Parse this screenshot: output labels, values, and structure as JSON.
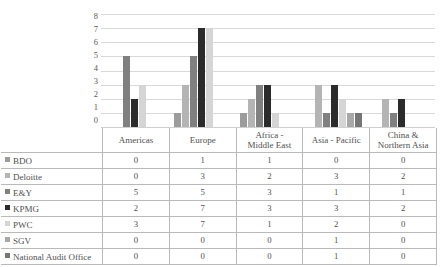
{
  "chart_data": {
    "type": "bar",
    "title": "",
    "subtitle": "",
    "xlabel": "",
    "ylabel": "",
    "ylim": [
      0,
      8
    ],
    "yticks": [
      8,
      7,
      6,
      5,
      4,
      3,
      2,
      1,
      0
    ],
    "grid": true,
    "legend_position": "table",
    "categories": [
      "Americas",
      "Europe",
      "Africa - Middle East",
      "Asia - Pacific",
      "China & Northern Asia"
    ],
    "category_lines": [
      [
        "Americas"
      ],
      [
        "Europe"
      ],
      [
        "Africa -",
        "Middle East"
      ],
      [
        "Asia - Pacific"
      ],
      [
        "China &",
        "Northern Asia"
      ]
    ],
    "series": [
      {
        "name": "BDO",
        "color": "#9c9c9c",
        "values": [
          0,
          1,
          1,
          0,
          0
        ]
      },
      {
        "name": "Deloitte",
        "color": "#b4b4b4",
        "values": [
          0,
          3,
          2,
          3,
          2
        ]
      },
      {
        "name": "E&Y",
        "color": "#808080",
        "values": [
          5,
          5,
          3,
          1,
          1
        ]
      },
      {
        "name": "KPMG",
        "color": "#2b2b2b",
        "values": [
          2,
          7,
          3,
          3,
          2
        ]
      },
      {
        "name": "PWC",
        "color": "#d5d5d5",
        "values": [
          3,
          7,
          1,
          2,
          0
        ]
      },
      {
        "name": "SGV",
        "color": "#a8a8a8",
        "values": [
          0,
          0,
          0,
          1,
          0
        ]
      },
      {
        "name": "National Audit Office",
        "color": "#767676",
        "values": [
          0,
          0,
          0,
          1,
          0
        ]
      }
    ]
  },
  "table": {
    "corner_label": "",
    "row_labels": [
      "BDO",
      "Deloitte",
      "E&Y",
      "KPMG",
      "PWC",
      "SGV",
      "National Audit Office"
    ],
    "column_headers": [
      "Americas",
      "Europe",
      "Africa - Middle East",
      "Asia - Pacific",
      "China & Northern Asia"
    ],
    "rows": [
      {
        "label": "BDO",
        "values": [
          0,
          1,
          1,
          0,
          0
        ]
      },
      {
        "label": "Deloitte",
        "values": [
          0,
          3,
          2,
          3,
          2
        ]
      },
      {
        "label": "E&Y",
        "values": [
          5,
          5,
          3,
          1,
          1
        ]
      },
      {
        "label": "KPMG",
        "values": [
          2,
          7,
          3,
          3,
          2
        ]
      },
      {
        "label": "PWC",
        "values": [
          3,
          7,
          1,
          2,
          0
        ]
      },
      {
        "label": "SGV",
        "values": [
          0,
          0,
          0,
          1,
          0
        ]
      },
      {
        "label": "National Audit Office",
        "values": [
          0,
          0,
          0,
          1,
          0
        ]
      }
    ]
  },
  "colors": {
    "gridline": "#d9d9d9",
    "border": "#b9b9b9",
    "text": "#4f4f4f",
    "axis_text": "#595959"
  }
}
